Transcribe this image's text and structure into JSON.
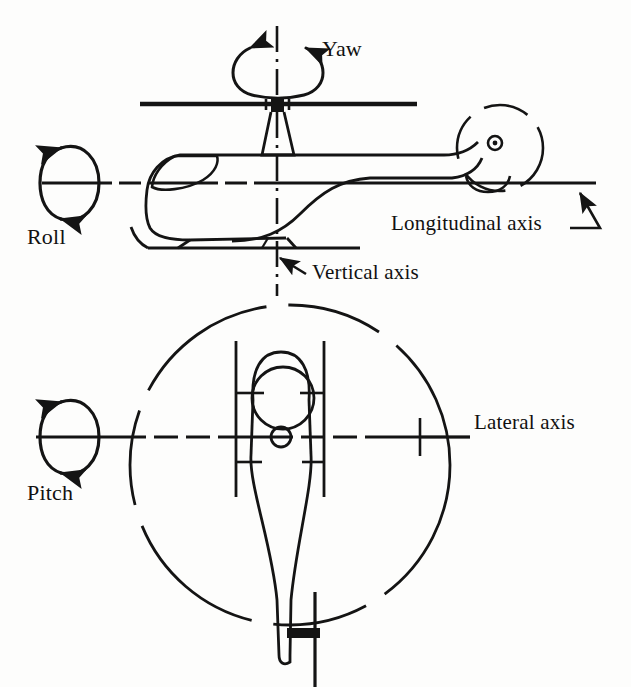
{
  "figure": {
    "background_color": "#fdfdfc",
    "ink_color": "#141414",
    "cropped_top_text": "",
    "views": [
      {
        "name": "side-view",
        "description": "Helicopter side elevation showing longitudinal and vertical axes"
      },
      {
        "name": "top-view",
        "description": "Helicopter plan view showing lateral axis and main rotor disc"
      }
    ]
  },
  "labels": {
    "yaw": "Yaw",
    "roll": "Roll",
    "pitch": "Pitch",
    "longitudinal_axis": "Longitudinal axis",
    "vertical_axis": "Vertical axis",
    "lateral_axis": "Lateral axis"
  },
  "axes": [
    {
      "id": "longitudinal",
      "label": "Longitudinal axis",
      "rotation": "Roll",
      "orientation": "horizontal",
      "view": "side-view",
      "line_style": "dash-dot",
      "y": 183,
      "x_start": 42,
      "x_end": 596
    },
    {
      "id": "vertical",
      "label": "Vertical axis",
      "rotation": "Yaw",
      "orientation": "vertical",
      "view": "side-view",
      "line_style": "dash-dot",
      "x": 277,
      "y_start": 26,
      "y_end": 296
    },
    {
      "id": "lateral",
      "label": "Lateral axis",
      "rotation": "Pitch",
      "orientation": "horizontal",
      "view": "top-view",
      "line_style": "dash-dot",
      "y": 437,
      "x_start": 36,
      "x_end": 470
    }
  ],
  "rotation_arrows": [
    {
      "id": "yaw-arrow",
      "label": "Yaw",
      "shape": "horizontal-ellipse",
      "cx": 277,
      "cy": 70,
      "rx": 38,
      "ry": 27,
      "arrowheads": 2
    },
    {
      "id": "roll-arrow",
      "label": "Roll",
      "shape": "vertical-ellipse",
      "cx": 73,
      "cy": 183,
      "rx": 24,
      "ry": 42,
      "arrowheads": 2
    },
    {
      "id": "pitch-arrow",
      "label": "Pitch",
      "shape": "vertical-ellipse",
      "cx": 73,
      "cy": 437,
      "rx": 24,
      "ry": 42,
      "arrowheads": 2
    }
  ],
  "callouts": [
    {
      "id": "longitudinal-callout",
      "label": "Longitudinal axis",
      "points_to": "longitudinal-axis-right-end"
    },
    {
      "id": "vertical-callout",
      "label": "Vertical axis",
      "points_to": "vertical-axis-lower-end"
    }
  ],
  "side_view_parts": [
    {
      "name": "main-rotor-blade",
      "type": "line",
      "y": 104,
      "x_start": 140,
      "x_end": 417
    },
    {
      "name": "rotor-hub",
      "type": "marker",
      "x": 277,
      "y": 104
    },
    {
      "name": "rotor-mast",
      "type": "tapered-column"
    },
    {
      "name": "cabin-fuselage",
      "type": "outline"
    },
    {
      "name": "cockpit-window",
      "type": "outline"
    },
    {
      "name": "tail-boom",
      "type": "outline"
    },
    {
      "name": "tail-rotor-disc",
      "type": "dashed-circle",
      "cx": 500,
      "cy": 148,
      "r": 43
    },
    {
      "name": "tail-rotor-hub",
      "type": "small-circle",
      "cx": 495,
      "cy": 143,
      "r": 5
    },
    {
      "name": "landing-skid",
      "type": "line",
      "y": 248,
      "x_start": 148,
      "x_end": 360
    }
  ],
  "top_view_parts": [
    {
      "name": "main-rotor-disc",
      "type": "dashed-circle",
      "cx": 290,
      "cy": 465,
      "r": 160
    },
    {
      "name": "cockpit-canopy",
      "type": "outline"
    },
    {
      "name": "cabin-dome",
      "type": "circle",
      "cx": 283,
      "cy": 398,
      "r": 31
    },
    {
      "name": "rotor-hub",
      "type": "circle",
      "cx": 281,
      "cy": 437,
      "r": 10
    },
    {
      "name": "left-skid-rail",
      "type": "line",
      "x": 236,
      "y_start": 341,
      "y_end": 497
    },
    {
      "name": "right-skid-rail",
      "type": "line",
      "x": 324,
      "y_start": 341,
      "y_end": 497
    },
    {
      "name": "tail-boom",
      "type": "taper"
    },
    {
      "name": "tail-rotor",
      "type": "cross",
      "x": 315,
      "y": 640
    }
  ]
}
